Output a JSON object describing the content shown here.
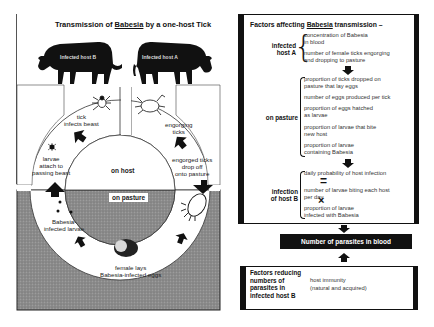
{
  "left_diagram": {
    "title_prefix": "Transmission of ",
    "title_emph": "Babesia",
    "title_suffix": " by a one-host Tick",
    "cow_b_label": "Infected host B",
    "cow_a_label": "Infected host A",
    "labels": {
      "tick_infects": "tick\ninfects beast",
      "engorging": "engorging\nticks",
      "larvae_attach": "larvae\nattach to\npassing beast",
      "on_host": "on host",
      "engorged_drop": "engorged ticks\ndrop off\nonto pasture",
      "on_pasture": "on pasture",
      "infected_larvae": "Babesia-\ninfected larvae",
      "female_lays": "female lays\nBabesia-infected eggs"
    },
    "colors": {
      "pasture": "#8a8a8a",
      "ring": "#ffffff",
      "ink": "#111111"
    }
  },
  "right_panel": {
    "title_prefix": "Factors affecting ",
    "title_emph": "Babesia",
    "title_suffix": " transmission –",
    "groups": [
      {
        "heading": "infected\nhost A",
        "items": [
          "concentration of Babesia\nin blood",
          "number of female ticks engorging\nand dropping to pasture"
        ]
      },
      {
        "heading": "on pasture",
        "items": [
          "proportion of ticks dropped on\npasture that lay eggs",
          "number of eggs produced per tick",
          "proportion of eggs hatched\nas larvae",
          "proportion of larvae that bite\nnew host",
          "proportion of larvae\ncontaining Babesia"
        ]
      },
      {
        "heading": "infection\nof host B",
        "items": [
          "daily probability of host infection",
          "=",
          "number of larvae biting each host\nper day",
          "×",
          "proportion of larvae\ninfected with Babesia"
        ]
      }
    ],
    "result_bar": "Number of parasites in blood"
  },
  "bottom_panel": {
    "heading": "Factors reducing\nnumbers of\nparasites in\ninfected host B",
    "text": "host immunity\n(natural and acquired)"
  }
}
